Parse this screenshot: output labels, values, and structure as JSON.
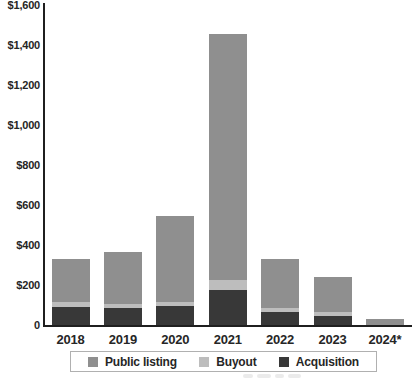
{
  "chart_data": {
    "type": "bar",
    "stacked": true,
    "title": "",
    "categories": [
      "2018",
      "2019",
      "2020",
      "2021",
      "2022",
      "2023",
      "2024*"
    ],
    "series": [
      {
        "name": "Public listing",
        "color": "#8f8f8f",
        "values": [
          215,
          260,
          430,
          1230,
          245,
          175,
          30
        ]
      },
      {
        "name": "Buyout",
        "color": "#bdbdbd",
        "values": [
          25,
          20,
          20,
          50,
          20,
          20,
          0
        ]
      },
      {
        "name": "Acquisition",
        "color": "#383838",
        "values": [
          90,
          85,
          95,
          175,
          65,
          45,
          0
        ]
      }
    ],
    "stack_order_bottom_to_top": [
      "Acquisition",
      "Buyout",
      "Public listing"
    ],
    "totals": [
      330,
      365,
      545,
      1455,
      330,
      240,
      30
    ],
    "xlabel": "",
    "ylabel": "",
    "ylim": [
      0,
      1600
    ],
    "ytick_interval": 200,
    "yticks": [
      {
        "value": 1600,
        "label": "$1,600"
      },
      {
        "value": 1400,
        "label": "$1,400"
      },
      {
        "value": 1200,
        "label": "$1,200"
      },
      {
        "value": 1000,
        "label": "$1,000"
      },
      {
        "value": 800,
        "label": "$800"
      },
      {
        "value": 600,
        "label": "$600"
      },
      {
        "value": 400,
        "label": "$400"
      },
      {
        "value": 200,
        "label": "$200"
      },
      {
        "value": 0,
        "label": "0"
      }
    ],
    "legend": {
      "position": "bottom",
      "items": [
        {
          "label": "Public listing",
          "color": "#8f8f8f"
        },
        {
          "label": "Buyout",
          "color": "#bdbdbd"
        },
        {
          "label": "Acquisition",
          "color": "#383838"
        }
      ]
    },
    "grid": false,
    "axis_color": "#1f1f1f",
    "background_color": "#ffffff"
  }
}
